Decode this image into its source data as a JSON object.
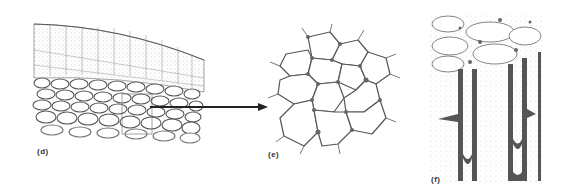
{
  "figure": {
    "panels": [
      {
        "id": "d",
        "label": "(d)",
        "description": "cross-section of tissue showing stippled outer cell layers above rows of rounded thick-walled cells"
      },
      {
        "id": "e",
        "label": "(e)",
        "description": "enlarged cluster of polygonal cells with thickened corners"
      },
      {
        "id": "f",
        "label": "(f)",
        "description": "elongated cells with thick dark walls extending downward"
      }
    ],
    "arrow": {
      "from": "d",
      "to": "e"
    },
    "colors": {
      "ink": "#333333",
      "stipple": "#9a9a9a",
      "background": "#ffffff",
      "dark_wall": "#555555"
    }
  }
}
